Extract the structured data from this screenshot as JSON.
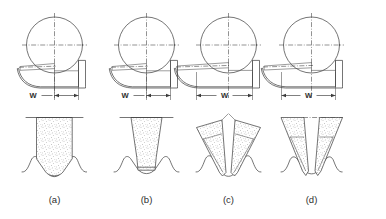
{
  "figure": {
    "background_color": "#ffffff",
    "line_color": "#3a3a3a",
    "stipple_color": "#6e6e6e",
    "panel_count": 4
  },
  "dimension_label": "W",
  "captions": [
    {
      "id": "a",
      "label": "(a)"
    },
    {
      "id": "b",
      "label": "(b)"
    },
    {
      "id": "c",
      "label": "(c)"
    },
    {
      "id": "d",
      "label": "(d)"
    }
  ],
  "panels": [
    {
      "id": "a",
      "caption": "(a)",
      "dim_label": "W",
      "dim_label_side": "left",
      "dim_arrows": "outward",
      "wheel_profile": "wide-block-round-v-tip",
      "top_view": "single-point-dresser-full-width",
      "workpiece_groove": "wide-round-bottom"
    },
    {
      "id": "b",
      "caption": "(b)",
      "dim_label": "W",
      "dim_label_side": "left",
      "dim_arrows": "outward",
      "wheel_profile": "tapered-flat-tip",
      "top_view": "single-point-dresser-partial-width",
      "workpiece_groove": "narrow-flat-bottom"
    },
    {
      "id": "c",
      "caption": "(c)",
      "dim_label": "W",
      "dim_label_side": "center",
      "dim_arrows": "inward",
      "wheel_profile": "twin-converging-wedges",
      "top_view": "angled-dresser-wide-width",
      "workpiece_groove": "deep-narrow-v"
    },
    {
      "id": "d",
      "caption": "(d)",
      "dim_label": "W",
      "dim_label_side": "center",
      "dim_arrows": "inward",
      "wheel_profile": "split-twin-wedges",
      "top_view": "angled-dresser-wide-width",
      "workpiece_groove": "double-wave-ridge"
    }
  ]
}
